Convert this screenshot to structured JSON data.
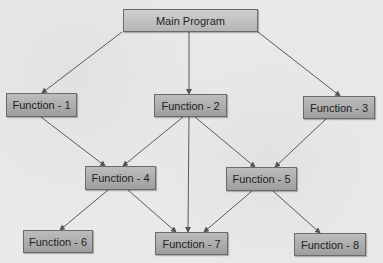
{
  "diagram": {
    "title": "",
    "nodes": [
      {
        "id": "main",
        "label": "Main Program",
        "x": 123,
        "y": 9,
        "w": 135,
        "h": 23
      },
      {
        "id": "f1",
        "label": "Function - 1",
        "x": 6,
        "y": 93,
        "w": 71,
        "h": 24
      },
      {
        "id": "f2",
        "label": "Function - 2",
        "x": 154,
        "y": 94,
        "w": 73,
        "h": 23
      },
      {
        "id": "f3",
        "label": "Function - 3",
        "x": 303,
        "y": 96,
        "w": 72,
        "h": 23
      },
      {
        "id": "f4",
        "label": "Function - 4",
        "x": 85,
        "y": 166,
        "w": 71,
        "h": 24
      },
      {
        "id": "f5",
        "label": "Function - 5",
        "x": 226,
        "y": 167,
        "w": 71,
        "h": 24
      },
      {
        "id": "f6",
        "label": "Function - 6",
        "x": 23,
        "y": 230,
        "w": 70,
        "h": 23
      },
      {
        "id": "f7",
        "label": "Function - 7",
        "x": 155,
        "y": 232,
        "w": 73,
        "h": 23
      },
      {
        "id": "f8",
        "label": "Function - 8",
        "x": 294,
        "y": 233,
        "w": 72,
        "h": 23
      }
    ],
    "edges": [
      {
        "from": "main",
        "to": "f1",
        "x1": 122,
        "y1": 32,
        "x2": 42,
        "y2": 93
      },
      {
        "from": "main",
        "to": "f2",
        "x1": 189,
        "y1": 32,
        "x2": 189,
        "y2": 94
      },
      {
        "from": "main",
        "to": "f3",
        "x1": 258,
        "y1": 32,
        "x2": 340,
        "y2": 96
      },
      {
        "from": "f1",
        "to": "f4",
        "x1": 41,
        "y1": 117,
        "x2": 105,
        "y2": 166
      },
      {
        "from": "f2",
        "to": "f4",
        "x1": 183,
        "y1": 117,
        "x2": 123,
        "y2": 166
      },
      {
        "from": "f2",
        "to": "f7",
        "x1": 189,
        "y1": 117,
        "x2": 188,
        "y2": 232
      },
      {
        "from": "f2",
        "to": "f5",
        "x1": 195,
        "y1": 117,
        "x2": 255,
        "y2": 167
      },
      {
        "from": "f3",
        "to": "f5",
        "x1": 326,
        "y1": 119,
        "x2": 275,
        "y2": 167
      },
      {
        "from": "f4",
        "to": "f6",
        "x1": 108,
        "y1": 190,
        "x2": 60,
        "y2": 230
      },
      {
        "from": "f4",
        "to": "f7",
        "x1": 128,
        "y1": 190,
        "x2": 176,
        "y2": 232
      },
      {
        "from": "f5",
        "to": "f7",
        "x1": 252,
        "y1": 191,
        "x2": 204,
        "y2": 232
      },
      {
        "from": "f5",
        "to": "f8",
        "x1": 273,
        "y1": 191,
        "x2": 320,
        "y2": 233
      }
    ]
  }
}
